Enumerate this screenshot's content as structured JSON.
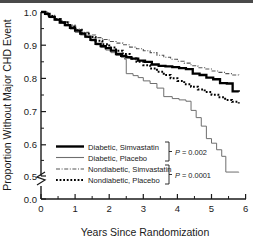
{
  "chart_data": {
    "type": "line",
    "title": "",
    "xlabel": "Years Since Randomization",
    "ylabel": "Proportion Without Major CHD Event",
    "xlim": [
      0,
      6
    ],
    "ylim": [
      0.5,
      1.0
    ],
    "y_axis_break": true,
    "y_break_note": "axis broken between 0.0 and 0.5",
    "grid": false,
    "legend_position": "lower-left-inside",
    "xticks": [
      "0",
      "1",
      "2",
      "3",
      "4",
      "5",
      "6"
    ],
    "xtick_values": [
      0,
      1,
      2,
      3,
      4,
      5,
      6
    ],
    "x_minor_ticks": [
      0.5,
      1.5,
      2.5,
      3.5,
      4.5,
      5.5
    ],
    "yticks": [
      "0.0",
      "0.5",
      "0.6",
      "0.7",
      "0.8",
      "0.9",
      "1.0"
    ],
    "ytick_values": [
      0.0,
      0.5,
      0.6,
      0.7,
      0.8,
      0.9,
      1.0
    ],
    "y_minor_ticks": [
      0.55,
      0.65,
      0.75,
      0.85,
      0.95
    ],
    "series": [
      {
        "name": "Diabetic, Simvastatin",
        "style": "solid",
        "color": "#000000",
        "width": 2.3,
        "points": [
          [
            0.0,
            1.0
          ],
          [
            0.12,
            0.994
          ],
          [
            0.25,
            0.985
          ],
          [
            0.4,
            0.977
          ],
          [
            0.55,
            0.968
          ],
          [
            0.7,
            0.96
          ],
          [
            0.85,
            0.952
          ],
          [
            1.0,
            0.943
          ],
          [
            1.15,
            0.934
          ],
          [
            1.3,
            0.925
          ],
          [
            1.45,
            0.915
          ],
          [
            1.6,
            0.903
          ],
          [
            1.75,
            0.896
          ],
          [
            1.9,
            0.89
          ],
          [
            2.05,
            0.882
          ],
          [
            2.2,
            0.872
          ],
          [
            2.35,
            0.866
          ],
          [
            2.5,
            0.862
          ],
          [
            2.65,
            0.858
          ],
          [
            2.85,
            0.852
          ],
          [
            3.05,
            0.848
          ],
          [
            3.25,
            0.84
          ],
          [
            3.45,
            0.836
          ],
          [
            3.65,
            0.834
          ],
          [
            3.85,
            0.832
          ],
          [
            4.05,
            0.829
          ],
          [
            4.25,
            0.826
          ],
          [
            4.45,
            0.812
          ],
          [
            4.65,
            0.808
          ],
          [
            4.85,
            0.8
          ],
          [
            5.05,
            0.795
          ],
          [
            5.25,
            0.783
          ],
          [
            5.45,
            0.782
          ],
          [
            5.62,
            0.758
          ],
          [
            5.8,
            0.757
          ]
        ]
      },
      {
        "name": "Diabetic, Placebo",
        "style": "solid",
        "color": "#6e6e6e",
        "width": 1.0,
        "points": [
          [
            0.0,
            1.0
          ],
          [
            0.12,
            0.992
          ],
          [
            0.25,
            0.983
          ],
          [
            0.4,
            0.975
          ],
          [
            0.55,
            0.966
          ],
          [
            0.7,
            0.958
          ],
          [
            0.85,
            0.948
          ],
          [
            1.0,
            0.938
          ],
          [
            1.15,
            0.93
          ],
          [
            1.3,
            0.922
          ],
          [
            1.45,
            0.912
          ],
          [
            1.6,
            0.9
          ],
          [
            1.75,
            0.892
          ],
          [
            1.9,
            0.884
          ],
          [
            2.05,
            0.876
          ],
          [
            2.2,
            0.868
          ],
          [
            2.35,
            0.862
          ],
          [
            2.45,
            0.856
          ],
          [
            2.5,
            0.812
          ],
          [
            2.7,
            0.806
          ],
          [
            2.85,
            0.8
          ],
          [
            3.0,
            0.79
          ],
          [
            3.2,
            0.782
          ],
          [
            3.4,
            0.768
          ],
          [
            3.6,
            0.742
          ],
          [
            3.85,
            0.736
          ],
          [
            4.05,
            0.732
          ],
          [
            4.25,
            0.728
          ],
          [
            4.4,
            0.7
          ],
          [
            4.55,
            0.678
          ],
          [
            4.7,
            0.652
          ],
          [
            4.85,
            0.614
          ],
          [
            5.0,
            0.6
          ],
          [
            5.15,
            0.58
          ],
          [
            5.3,
            0.56
          ],
          [
            5.42,
            0.512
          ],
          [
            5.8,
            0.511
          ]
        ]
      },
      {
        "name": "Nondiabetic, Simvastatin",
        "style": "dashdot",
        "color": "#555555",
        "width": 1.1,
        "points": [
          [
            0.0,
            1.0
          ],
          [
            0.2,
            0.99
          ],
          [
            0.4,
            0.98
          ],
          [
            0.6,
            0.97
          ],
          [
            0.8,
            0.96
          ],
          [
            1.0,
            0.948
          ],
          [
            1.2,
            0.938
          ],
          [
            1.4,
            0.93
          ],
          [
            1.6,
            0.922
          ],
          [
            1.8,
            0.916
          ],
          [
            2.0,
            0.91
          ],
          [
            2.2,
            0.905
          ],
          [
            2.4,
            0.9
          ],
          [
            2.6,
            0.893
          ],
          [
            2.8,
            0.888
          ],
          [
            3.0,
            0.882
          ],
          [
            3.2,
            0.876
          ],
          [
            3.4,
            0.868
          ],
          [
            3.6,
            0.862
          ],
          [
            3.8,
            0.856
          ],
          [
            4.0,
            0.85
          ],
          [
            4.2,
            0.844
          ],
          [
            4.4,
            0.836
          ],
          [
            4.6,
            0.83
          ],
          [
            4.8,
            0.826
          ],
          [
            5.0,
            0.82
          ],
          [
            5.2,
            0.816
          ],
          [
            5.4,
            0.812
          ],
          [
            5.6,
            0.808
          ],
          [
            5.8,
            0.804
          ]
        ]
      },
      {
        "name": "Nondiabetic, Placebo",
        "style": "dotted",
        "color": "#000000",
        "width": 2.0,
        "points": [
          [
            0.0,
            1.0
          ],
          [
            0.2,
            0.988
          ],
          [
            0.4,
            0.978
          ],
          [
            0.6,
            0.968
          ],
          [
            0.8,
            0.956
          ],
          [
            1.0,
            0.944
          ],
          [
            1.2,
            0.934
          ],
          [
            1.4,
            0.924
          ],
          [
            1.6,
            0.912
          ],
          [
            1.8,
            0.902
          ],
          [
            2.0,
            0.892
          ],
          [
            2.2,
            0.882
          ],
          [
            2.4,
            0.872
          ],
          [
            2.6,
            0.858
          ],
          [
            2.8,
            0.848
          ],
          [
            3.0,
            0.838
          ],
          [
            3.2,
            0.828
          ],
          [
            3.4,
            0.818
          ],
          [
            3.6,
            0.808
          ],
          [
            3.8,
            0.798
          ],
          [
            4.0,
            0.79
          ],
          [
            4.2,
            0.78
          ],
          [
            4.4,
            0.772
          ],
          [
            4.6,
            0.764
          ],
          [
            4.8,
            0.756
          ],
          [
            5.0,
            0.748
          ],
          [
            5.2,
            0.74
          ],
          [
            5.4,
            0.732
          ],
          [
            5.6,
            0.726
          ],
          [
            5.8,
            0.721
          ]
        ]
      }
    ],
    "annotations": [
      {
        "text": "P = 0.002",
        "p_symbol": "P",
        "rest": " = 0.002",
        "groups": [
          "Diabetic, Simvastatin",
          "Diabetic, Placebo"
        ]
      },
      {
        "text": "P = 0.0001",
        "p_symbol": "P",
        "rest": " = 0.0001",
        "groups": [
          "Nondiabetic, Simvastatin",
          "Nondiabetic, Placebo"
        ]
      }
    ]
  },
  "legend": {
    "items": [
      {
        "label": "Diabetic, Simvastatin"
      },
      {
        "label": "Diabetic, Placebo"
      },
      {
        "label": "Nondiabetic, Simvastatin"
      },
      {
        "label": "Nondiabetic, Placebo"
      }
    ]
  },
  "axes": {
    "x_title": "Years Since Randomization",
    "y_title": "Proportion Without Major CHD Event",
    "x_labels": [
      "0",
      "1",
      "2",
      "3",
      "4",
      "5",
      "6"
    ],
    "y_labels": [
      "0.0",
      "0.5",
      "0.6",
      "0.7",
      "0.8",
      "0.9",
      "1.0"
    ]
  },
  "pvalues": {
    "top_symbol": "P",
    "top_rest": " = 0.002",
    "bottom_symbol": "P",
    "bottom_rest": " = 0.0001"
  }
}
